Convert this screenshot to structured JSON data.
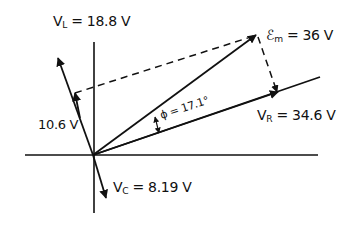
{
  "diagram": {
    "type": "phasor-diagram",
    "ink_color": "#111111",
    "background": "#ffffff",
    "labels": {
      "VL_symbol": "V",
      "VL_sub": "L",
      "VL_value": " = 18.8 V",
      "VLminusVC_value": "10.6 V",
      "VC_symbol": "V",
      "VC_sub": "C",
      "VC_value": " = 8.19 V",
      "Em_symbol": "ℰ",
      "Em_sub": "m",
      "Em_value": " = 36 V",
      "VR_symbol": "V",
      "VR_sub": "R",
      "VR_value": " = 34.6 V",
      "phi_label": "ϕ = 17.1°"
    },
    "phasors": [
      {
        "name": "V_L",
        "magnitude": 18.8,
        "unit": "V",
        "direction": "up (leading by 90° relative to V_R)"
      },
      {
        "name": "V_L - V_C",
        "magnitude": 10.6,
        "unit": "V"
      },
      {
        "name": "V_C",
        "magnitude": 8.19,
        "unit": "V",
        "direction": "down (lagging)"
      },
      {
        "name": "V_R",
        "magnitude": 34.6,
        "unit": "V"
      },
      {
        "name": "E_m",
        "magnitude": 36,
        "unit": "V"
      }
    ],
    "phase_angle_deg": 17.1
  }
}
